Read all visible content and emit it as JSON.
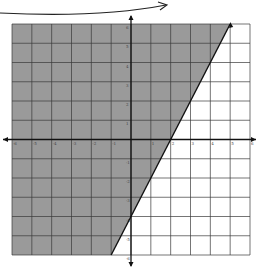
{
  "chart_data": {
    "type": "inequality-graph",
    "title": "",
    "xlim": [
      -6,
      6
    ],
    "ylim": [
      -6,
      6
    ],
    "grid": true,
    "x_ticks": [
      -6,
      -5,
      -4,
      -3,
      -2,
      -1,
      1,
      2,
      3,
      4,
      5,
      6
    ],
    "y_ticks": [
      -6,
      -5,
      -4,
      -3,
      -2,
      -1,
      1,
      2,
      3,
      4,
      5,
      6
    ],
    "boundary_line": {
      "equation": "y = 2x - 4",
      "slope": 2,
      "intercept": -4,
      "points": [
        [
          -1,
          -6
        ],
        [
          5,
          6
        ]
      ],
      "style": "solid"
    },
    "shaded_region": "left/above the line (y >= 2x - 4)",
    "colors": {
      "shade": "#9a9a9a",
      "grid": "#3a3a3a",
      "axis": "#111111",
      "background": "#ffffff"
    }
  },
  "annotation": {
    "arrow": "curved arrow pointing right at top (text cropped)"
  }
}
